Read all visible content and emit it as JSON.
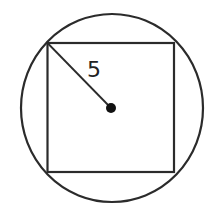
{
  "diagram": {
    "colors": {
      "stroke": "#2b2b2b",
      "background": "#ffffff",
      "center_dot": "#111111"
    },
    "circle": {
      "cx": 112,
      "cy": 108,
      "rx": 91,
      "ry": 94
    },
    "square": {
      "x": 47.5,
      "y": 43,
      "width": 126.5,
      "height": 129
    },
    "center": {
      "x": 111,
      "y": 108,
      "r": 5
    },
    "radius_segment": {
      "x1": 47.5,
      "y1": 43,
      "x2": 111,
      "y2": 108
    },
    "radius_label": {
      "text": "5",
      "x": 87,
      "y": 77
    }
  }
}
